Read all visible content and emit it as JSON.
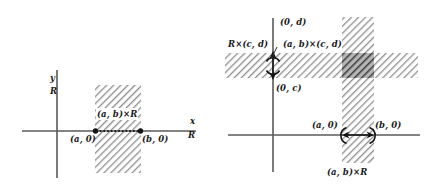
{
  "figure": {
    "background": "#ffffff",
    "ink_color": "#444444",
    "hatch_color": "#8a8a8a",
    "overlap_color": "#5e5e5e"
  },
  "left_panel": {
    "name": "left-diagram",
    "axes": {
      "y_axis_label_top": "y",
      "y_axis_label_set": "R",
      "x_axis_label_top": "x",
      "x_axis_label_set": "R"
    },
    "region_label": "(a, b)×R",
    "points": [
      {
        "label": "(a, 0)"
      },
      {
        "label": "(b, 0)"
      }
    ]
  },
  "right_panel": {
    "name": "right-diagram",
    "labels": {
      "horizontal_strip": "R×(c, d)",
      "intersection": "(a, b)×(c, d)",
      "top_point": "(0, d)",
      "bottom_point": "(0, c)",
      "left_point": "(a, 0)",
      "right_point": "(b, 0)",
      "vertical_strip": "(a, b)×R"
    }
  }
}
